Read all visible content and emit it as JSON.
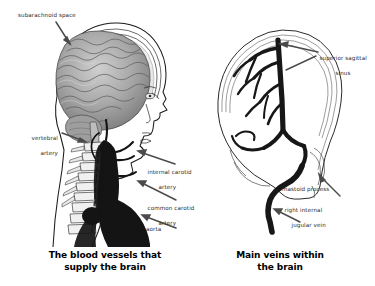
{
  "figure": {
    "type": "anatomical-illustration",
    "background_color": "#ffffff",
    "ink_color": "#1a1a1a",
    "panel_count": 2
  },
  "panels": [
    {
      "id": "left",
      "caption_line1": "The blood vessels that",
      "caption_line2": "supply the brain",
      "subject": "lateral head and neck with brain, cervical spine and arterial supply",
      "labels": [
        {
          "name": "subarachnoid-space",
          "line1": "subarachnoid space",
          "line2": "",
          "align": "left"
        },
        {
          "name": "vertebral-artery",
          "line1": "vertebral",
          "line2": "artery",
          "align": "right"
        },
        {
          "name": "internal-carotid-artery",
          "line1": "internal carotid",
          "line2": "artery",
          "align": "left"
        },
        {
          "name": "common-carotid-artery",
          "line1": "common carotid",
          "line2": "artery",
          "align": "left"
        },
        {
          "name": "aorta",
          "line1": "aorta",
          "line2": "",
          "align": "left"
        }
      ]
    },
    {
      "id": "right",
      "caption_line1": "Main veins within",
      "caption_line2": "the brain",
      "subject": "skull with cerebral venous sinuses and jugular vein",
      "labels": [
        {
          "name": "superior-sagittal-sinus",
          "line1": "superior sagittal",
          "line2": "sinus",
          "align": "left"
        },
        {
          "name": "mastoid-process",
          "line1": "mastoid process",
          "line2": "",
          "align": "left"
        },
        {
          "name": "right-internal-jugular-vein",
          "line1": "right internal",
          "line2": "jugular vein",
          "align": "left"
        }
      ]
    }
  ]
}
